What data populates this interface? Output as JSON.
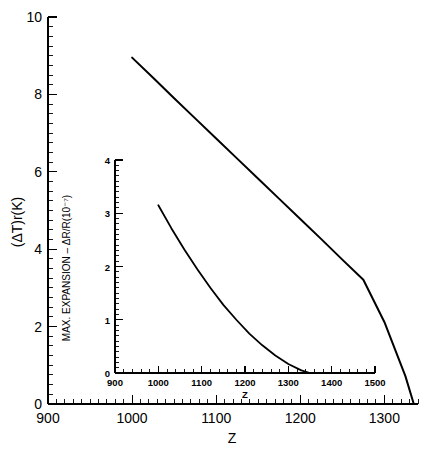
{
  "figure": {
    "background_color": "#ffffff",
    "line_color": "#000000"
  },
  "chart_data": [
    {
      "id": "main",
      "type": "line",
      "title": "",
      "xlabel": "Z",
      "ylabel": "(ΔT)r(K)",
      "xlim": [
        900,
        1340
      ],
      "ylim": [
        0,
        10
      ],
      "xticks": [
        900,
        1000,
        1100,
        1200,
        1300
      ],
      "xtick_labels": [
        "900",
        "1000",
        "1100",
        "1200",
        "1300"
      ],
      "yticks": [
        0,
        2,
        4,
        6,
        8,
        10
      ],
      "ytick_labels": [
        "0",
        "2",
        "4",
        "6",
        "8",
        "10"
      ],
      "x_minor_step": 10,
      "y_minor_step": 0.25,
      "grid": false,
      "legend": false,
      "series": [
        {
          "name": "(ΔT)r",
          "x": [
            1000,
            1025,
            1050,
            1075,
            1100,
            1125,
            1150,
            1175,
            1200,
            1225,
            1250,
            1275,
            1300,
            1325,
            1335
          ],
          "values": [
            8.95,
            8.43,
            7.9,
            7.38,
            6.86,
            6.34,
            5.82,
            5.3,
            4.78,
            4.26,
            3.73,
            3.21,
            2.12,
            0.72,
            0.0
          ]
        }
      ]
    },
    {
      "id": "inset",
      "type": "line",
      "title": "",
      "xlabel": "Z",
      "ylabel": "MAX. EXPANSION – ΔR/R(10⁻⁷)",
      "xlim": [
        900,
        1500
      ],
      "ylim": [
        0,
        4
      ],
      "xticks": [
        900,
        1000,
        1100,
        1200,
        1300,
        1400,
        1500
      ],
      "xtick_labels": [
        "900",
        "1000",
        "1100",
        "1200",
        "1300",
        "1400",
        "1500"
      ],
      "yticks": [
        0,
        1,
        2,
        3,
        4
      ],
      "ytick_labels": [
        "0",
        "1",
        "2",
        "3",
        "4"
      ],
      "x_minor_step": 20,
      "y_minor_step": 0.1,
      "grid": false,
      "legend": false,
      "series": [
        {
          "name": "MAX. EXPANSION ΔR/R",
          "x": [
            1000,
            1030,
            1060,
            1090,
            1120,
            1150,
            1180,
            1210,
            1240,
            1270,
            1300,
            1330,
            1350
          ],
          "values": [
            3.15,
            2.72,
            2.32,
            1.95,
            1.6,
            1.28,
            1.0,
            0.74,
            0.52,
            0.33,
            0.17,
            0.05,
            0.0
          ]
        }
      ]
    }
  ]
}
